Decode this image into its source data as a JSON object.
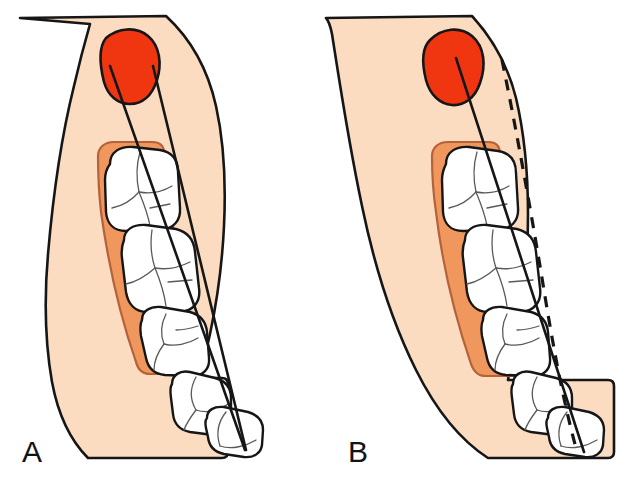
{
  "figure": {
    "panels": [
      {
        "id": "A",
        "label": "A",
        "caption": "Occlusal view of mandible showing needle path toward the lingula",
        "has_dashed_reference_line": false,
        "elements": {
          "mandible_body": "mandible-outline",
          "gingiva": "alveolar-gingiva",
          "teeth_count": 5,
          "marker": "lingula-marker",
          "lines": [
            "needle-path-line",
            "ramus-medial-line"
          ]
        }
      },
      {
        "id": "B",
        "label": "B",
        "caption": "Occlusal view of mandible with dashed reference line along posterior ramus border",
        "has_dashed_reference_line": true,
        "elements": {
          "mandible_body": "mandible-outline",
          "gingiva": "alveolar-gingiva",
          "teeth_count": 5,
          "marker": "lingula-marker",
          "lines": [
            "needle-path-line",
            "posterior-border-dashed-line"
          ]
        }
      }
    ]
  },
  "colors": {
    "bone_fill": "#FBDCC0",
    "gingiva_fill": "#F0975E",
    "marker_fill": "#F03611",
    "tooth_fill": "#FFFFFF",
    "outline": "#161616",
    "fissure_line": "#4A4A4A",
    "background": "#FFFFFF",
    "label_text": "#131313"
  },
  "teeth": {
    "names": [
      "second-molar",
      "first-molar",
      "second-premolar",
      "first-premolar",
      "canine"
    ]
  },
  "annotations": {
    "marker_name": "lingula-marker",
    "needle_line_name": "needle-path-line",
    "dashed_line_name": "posterior-border-dashed-line"
  }
}
